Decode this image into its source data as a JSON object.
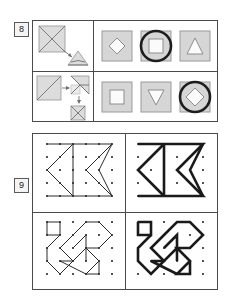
{
  "page": {
    "background_color": "#ffffff"
  },
  "questions": [
    {
      "number": "8",
      "label": "8",
      "panel_name": "question-8-panel",
      "rows": [
        {
          "prompt": {
            "name": "question-8-row-1-prompt",
            "description": "Square with both diagonals drawn, arrow pointing to a flattened folded triangle",
            "shapes": [
              "square-with-x-diagonals",
              "arrow",
              "folded-flat-triangle"
            ]
          },
          "options": [
            {
              "name": "option-diamond",
              "shape": "diamond",
              "selected": false
            },
            {
              "name": "option-square",
              "shape": "square",
              "selected": true
            },
            {
              "name": "option-triangle",
              "shape": "triangle-up",
              "selected": false
            }
          ]
        },
        {
          "prompt": {
            "name": "question-8-row-2-prompt",
            "description": "Square with one diagonal, arrow to folded triangle, down arrow to small folded square",
            "shapes": [
              "square-with-diagonal",
              "arrow-right",
              "folded-triangle",
              "arrow-down",
              "small-folded-square"
            ]
          },
          "options": [
            {
              "name": "option-square",
              "shape": "square",
              "selected": false
            },
            {
              "name": "option-triangle-down",
              "shape": "triangle-down",
              "selected": false
            },
            {
              "name": "option-diamond",
              "shape": "diamond",
              "selected": true
            }
          ]
        }
      ]
    },
    {
      "number": "9",
      "label": "9",
      "panel_name": "question-9-panel",
      "quadrants": [
        {
          "name": "quadrant-top-left",
          "style": "thin",
          "figure": "zigzag-arrow-figure",
          "grid": "6x6 dot grid"
        },
        {
          "name": "quadrant-top-right",
          "style": "thick",
          "figure": "zigzag-arrow-figure",
          "grid": "6x6 dot grid"
        },
        {
          "name": "quadrant-bottom-left",
          "style": "thin",
          "figure": "polygon-chain-figure",
          "grid": "6x6 dot grid"
        },
        {
          "name": "quadrant-bottom-right",
          "style": "thick",
          "figure": "polygon-chain-figure",
          "grid": "6x6 dot grid"
        }
      ]
    }
  ],
  "colors": {
    "border": "#4a4a4a",
    "tile_fill": "#d6d6d6",
    "ring_highlight": "#1d1d1d",
    "dot": "#1a1a1a",
    "text": "#1a1a1a"
  }
}
